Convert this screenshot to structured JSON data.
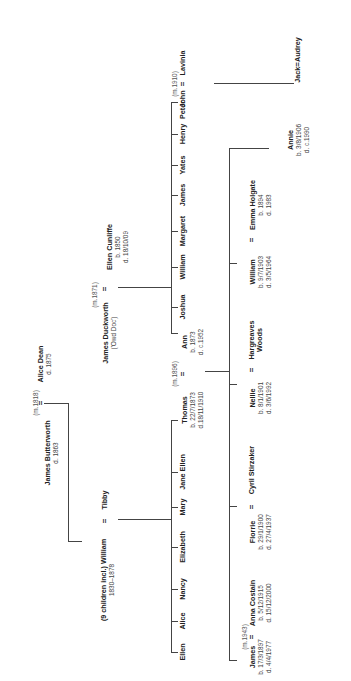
{
  "diagram": {
    "type": "family-tree",
    "orientation": "rotated-90-ccw",
    "line_color": "#444444",
    "text_color": "#222222"
  },
  "gen1": {
    "marriage": "(m.1818)",
    "husband": {
      "name": "James Butterworth",
      "death": "d. 1863"
    },
    "wife": {
      "name": "Alice Dean",
      "death": "d. 1875"
    }
  },
  "gen2": {
    "william": {
      "prefix": "(9 children incl.) William",
      "dates": "1830–1878"
    },
    "tibby": {
      "name": "Tibby"
    },
    "duckworth": {
      "marriage": "(m.1871)",
      "name": "James Duckworth",
      "nickname": "('Owd Doc')"
    },
    "cunliffe": {
      "name": "Ellen Cunliffe",
      "birth": "b. 1850",
      "death": "d. 18/10/09"
    }
  },
  "gen3": {
    "butterworth_children": [
      "Ellen",
      "Alice",
      "Nancy",
      "Elizabeth",
      "Mary",
      "Jane Ellen",
      "Thomas"
    ],
    "thomas": {
      "name": "Thomas",
      "birth": "b. 22/7/1873",
      "death": "d.18/11/1910"
    },
    "thomas_ann_marriage": "(m.1896)",
    "ann": {
      "name": "Ann",
      "birth": "b. 1873",
      "death": "d. c.1952"
    },
    "duckworth_children": [
      "Joshua",
      "William",
      "Margaret",
      "James",
      "Yates",
      "Henry",
      "Peter"
    ],
    "john": {
      "name": "John",
      "marriage": "(m.1910)"
    },
    "lavinia": {
      "name": "Lavinia"
    }
  },
  "gen4": {
    "james": {
      "name": "James",
      "marriage": "(m.1943)",
      "birth": "b. 17/3/1897",
      "death": "d. 4/4/1977"
    },
    "anna": {
      "name": "Anna Costain",
      "birth": "b. 5/12/1915",
      "death": "d. 15/12/2000"
    },
    "florrie": {
      "name": "Florrie",
      "birth": "b. 29/1/1900",
      "death": "d. 27/4/1937"
    },
    "cyril": {
      "name": "Cyril Stirzaker"
    },
    "nellie": {
      "name": "Nellie",
      "birth": "b. 8/1/1901",
      "death": "d. 3/6/1992"
    },
    "hargreaves": {
      "name": "Hargreaves",
      "name2": "Woods"
    },
    "william": {
      "name": "William",
      "birth": "b. 9/7/1903",
      "death": "d. 3/5/1964"
    },
    "emma": {
      "name": "Emma Holgate",
      "birth": "b. 1894",
      "death": "d. 1983"
    },
    "annie": {
      "name": "Annie",
      "birth": "b. 3/8/1906",
      "death": "d. c.1990"
    },
    "jack_audrey": {
      "name": "Jack",
      "spouse": "Audrey"
    }
  },
  "symbols": {
    "equals": "="
  }
}
